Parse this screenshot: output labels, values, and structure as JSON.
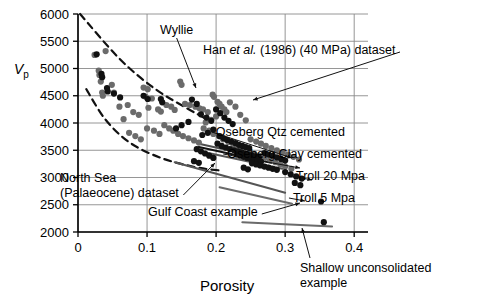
{
  "figure": {
    "background": "#ffffff",
    "ink": "#000000",
    "gridline_color": "#8a8a8a",
    "point_dark": "#111111",
    "point_gray": "#6b6b6b"
  },
  "chart_data": {
    "type": "scatter",
    "title": "",
    "xlabel": "Porosity",
    "ylabel": "Vp",
    "ylabel_parts": {
      "italic": "V",
      "subscript": "p"
    },
    "xlim": [
      0,
      0.42
    ],
    "ylim": [
      2000,
      6000
    ],
    "xticks": [
      0,
      0.1,
      0.2,
      0.3,
      0.4
    ],
    "xticklabels": [
      "0",
      "0.1",
      "0.2",
      "0.3",
      "0.4"
    ],
    "yticks": [
      2000,
      2500,
      3000,
      3500,
      4000,
      4500,
      5000,
      5500,
      6000
    ],
    "yticklabels": [
      "2000",
      "2500",
      "3000",
      "3500",
      "4000",
      "4500",
      "5000",
      "5500",
      "6000"
    ],
    "grid": true,
    "grid_axis": "both",
    "legend": "none",
    "series": [
      {
        "name": "Han et al. (1986) (40 MPa) dataset",
        "marker": "circle",
        "color": "#6b6b6b",
        "points": [
          [
            0.024,
            5250
          ],
          [
            0.04,
            5320
          ],
          [
            0.03,
            4960
          ],
          [
            0.031,
            4880
          ],
          [
            0.033,
            4760
          ],
          [
            0.049,
            4700
          ],
          [
            0.035,
            4560
          ],
          [
            0.036,
            4500
          ],
          [
            0.052,
            4560
          ],
          [
            0.095,
            4650
          ],
          [
            0.101,
            4620
          ],
          [
            0.098,
            4480
          ],
          [
            0.107,
            4450
          ],
          [
            0.148,
            4760
          ],
          [
            0.15,
            4700
          ],
          [
            0.06,
            4300
          ],
          [
            0.072,
            4330
          ],
          [
            0.08,
            4200
          ],
          [
            0.088,
            4150
          ],
          [
            0.066,
            4070
          ],
          [
            0.102,
            4280
          ],
          [
            0.116,
            4250
          ],
          [
            0.12,
            4210
          ],
          [
            0.128,
            4330
          ],
          [
            0.135,
            4300
          ],
          [
            0.14,
            4240
          ],
          [
            0.155,
            4350
          ],
          [
            0.162,
            4330
          ],
          [
            0.17,
            4300
          ],
          [
            0.176,
            4270
          ],
          [
            0.181,
            4250
          ],
          [
            0.188,
            4200
          ],
          [
            0.195,
            4520
          ],
          [
            0.197,
            4480
          ],
          [
            0.202,
            4390
          ],
          [
            0.205,
            4350
          ],
          [
            0.208,
            4300
          ],
          [
            0.212,
            4250
          ],
          [
            0.215,
            4200
          ],
          [
            0.2,
            4120
          ],
          [
            0.193,
            4060
          ],
          [
            0.185,
            4010
          ],
          [
            0.22,
            4380
          ],
          [
            0.228,
            4300
          ],
          [
            0.235,
            4150
          ],
          [
            0.243,
            4050
          ],
          [
            0.074,
            3820
          ],
          [
            0.083,
            3760
          ],
          [
            0.091,
            3700
          ],
          [
            0.1,
            3900
          ],
          [
            0.11,
            3860
          ],
          [
            0.118,
            3800
          ],
          [
            0.125,
            3960
          ],
          [
            0.132,
            3900
          ],
          [
            0.138,
            3860
          ],
          [
            0.145,
            3800
          ],
          [
            0.152,
            3760
          ],
          [
            0.16,
            3720
          ],
          [
            0.168,
            3680
          ],
          [
            0.175,
            3640
          ],
          [
            0.182,
            3900
          ],
          [
            0.19,
            3860
          ],
          [
            0.196,
            3800
          ],
          [
            0.204,
            3760
          ],
          [
            0.21,
            3700
          ],
          [
            0.218,
            3650
          ],
          [
            0.225,
            3600
          ],
          [
            0.232,
            3560
          ],
          [
            0.24,
            3520
          ],
          [
            0.248,
            3470
          ],
          [
            0.255,
            3440
          ],
          [
            0.262,
            3400
          ],
          [
            0.27,
            3360
          ],
          [
            0.278,
            3320
          ],
          [
            0.286,
            3280
          ],
          [
            0.293,
            3240
          ],
          [
            0.3,
            3200
          ],
          [
            0.309,
            3160
          ],
          [
            0.25,
            3700
          ],
          [
            0.258,
            3660
          ],
          [
            0.265,
            3620
          ],
          [
            0.272,
            3580
          ],
          [
            0.28,
            3540
          ],
          [
            0.288,
            3500
          ],
          [
            0.296,
            3460
          ],
          [
            0.304,
            3420
          ],
          [
            0.312,
            3380
          ],
          [
            0.32,
            3330
          ]
        ]
      },
      {
        "name": "North Sea (Palaeocene) dataset",
        "marker": "circle",
        "color": "#111111",
        "points": [
          [
            0.027,
            5260
          ],
          [
            0.034,
            4900
          ],
          [
            0.035,
            4840
          ],
          [
            0.042,
            4640
          ],
          [
            0.043,
            4580
          ],
          [
            0.052,
            4540
          ],
          [
            0.061,
            4470
          ],
          [
            0.095,
            4500
          ],
          [
            0.101,
            4440
          ],
          [
            0.12,
            4440
          ],
          [
            0.122,
            4380
          ],
          [
            0.165,
            4430
          ],
          [
            0.172,
            4350
          ],
          [
            0.16,
            4020
          ],
          [
            0.15,
            3960
          ],
          [
            0.142,
            3900
          ],
          [
            0.178,
            4160
          ],
          [
            0.186,
            4100
          ],
          [
            0.193,
            4040
          ],
          [
            0.2,
            4250
          ],
          [
            0.206,
            4180
          ],
          [
            0.212,
            4100
          ],
          [
            0.218,
            4040
          ],
          [
            0.224,
            3980
          ],
          [
            0.196,
            3880
          ],
          [
            0.188,
            3820
          ],
          [
            0.18,
            3780
          ],
          [
            0.205,
            3760
          ],
          [
            0.211,
            3720
          ],
          [
            0.216,
            3690
          ],
          [
            0.222,
            3660
          ],
          [
            0.228,
            3630
          ],
          [
            0.233,
            3600
          ],
          [
            0.238,
            3580
          ],
          [
            0.243,
            3560
          ],
          [
            0.248,
            3540
          ],
          [
            0.202,
            3620
          ],
          [
            0.208,
            3580
          ],
          [
            0.214,
            3550
          ],
          [
            0.22,
            3520
          ],
          [
            0.226,
            3500
          ],
          [
            0.232,
            3480
          ],
          [
            0.237,
            3460
          ],
          [
            0.242,
            3440
          ],
          [
            0.247,
            3420
          ],
          [
            0.252,
            3400
          ],
          [
            0.257,
            3390
          ],
          [
            0.262,
            3370
          ],
          [
            0.23,
            3420
          ],
          [
            0.235,
            3400
          ],
          [
            0.24,
            3380
          ],
          [
            0.245,
            3360
          ],
          [
            0.25,
            3340
          ],
          [
            0.255,
            3320
          ],
          [
            0.26,
            3300
          ],
          [
            0.265,
            3290
          ],
          [
            0.27,
            3450
          ],
          [
            0.276,
            3420
          ],
          [
            0.282,
            3400
          ],
          [
            0.288,
            3370
          ],
          [
            0.294,
            3340
          ],
          [
            0.3,
            3310
          ],
          [
            0.252,
            3260
          ],
          [
            0.258,
            3240
          ],
          [
            0.264,
            3220
          ],
          [
            0.27,
            3200
          ],
          [
            0.276,
            3180
          ],
          [
            0.282,
            3160
          ],
          [
            0.288,
            3140
          ],
          [
            0.172,
            3520
          ],
          [
            0.178,
            3480
          ],
          [
            0.184,
            3440
          ],
          [
            0.19,
            3400
          ],
          [
            0.196,
            3360
          ],
          [
            0.168,
            3300
          ],
          [
            0.175,
            3270
          ],
          [
            0.24,
            3180
          ],
          [
            0.246,
            3150
          ],
          [
            0.3,
            3100
          ],
          [
            0.308,
            3060
          ],
          [
            0.316,
            3020
          ],
          [
            0.324,
            2980
          ],
          [
            0.314,
            2900
          ],
          [
            0.322,
            2860
          ],
          [
            0.352,
            2560
          ],
          [
            0.356,
            2180
          ]
        ]
      }
    ],
    "curves": [
      {
        "name": "Wyllie time-average line",
        "style": "dashed",
        "color": "#111111",
        "points": [
          [
            0.003,
            6000
          ],
          [
            0.06,
            5180
          ],
          [
            0.11,
            4640
          ],
          [
            0.155,
            4290
          ],
          [
            0.185,
            4080
          ]
        ]
      },
      {
        "name": "lower-bound dashed curve",
        "style": "dashed",
        "color": "#111111",
        "points": [
          [
            0.012,
            4620
          ],
          [
            0.04,
            4060
          ],
          [
            0.075,
            3640
          ],
          [
            0.12,
            3360
          ],
          [
            0.17,
            3190
          ],
          [
            0.205,
            3130
          ]
        ]
      },
      {
        "name": "Oseberg Qtz cemented trend",
        "style": "solid",
        "color": "#4d4d4d",
        "points": [
          [
            0.175,
            3620
          ],
          [
            0.272,
            3350
          ]
        ]
      },
      {
        "name": "Oseberg Clay cemented trend",
        "style": "solid",
        "color": "#111111",
        "points": [
          [
            0.175,
            3560
          ],
          [
            0.28,
            3270
          ]
        ]
      },
      {
        "name": "Troll 20 Mpa trend",
        "style": "solid",
        "color": "#555555",
        "points": [
          [
            0.17,
            3500
          ],
          [
            0.296,
            3160
          ]
        ]
      },
      {
        "name": "Troll 5 Mpa trend",
        "style": "solid",
        "color": "#555555",
        "points": [
          [
            0.14,
            3280
          ],
          [
            0.3,
            2720
          ]
        ]
      },
      {
        "name": "Gulf Coast trend",
        "style": "solid",
        "color": "#6b6b6b",
        "points": [
          [
            0.205,
            2820
          ],
          [
            0.31,
            2520
          ]
        ]
      },
      {
        "name": "Shallow unconsolidated trend",
        "style": "solid",
        "color": "#6b6b6b",
        "points": [
          [
            0.238,
            2180
          ],
          [
            0.368,
            2100
          ]
        ]
      }
    ],
    "annotations": [
      {
        "id": "wyllie",
        "label": "Wyllie",
        "x": 160,
        "y": 34,
        "leader_to": [
          196,
          88
        ]
      },
      {
        "id": "han",
        "label_pre": "Han ",
        "label_italic": "et al.",
        "label_post": " (1986) (40 MPa) dataset",
        "x": 203,
        "y": 54,
        "leader_to": [
          253,
          100
        ]
      },
      {
        "id": "north-sea",
        "line1": "North Sea",
        "line2": "(Palaeocene) dataset",
        "x": 60,
        "y": 182,
        "leader_to": [
          215,
          163
        ]
      },
      {
        "id": "gulf-coast",
        "label": "Gulf Coast example",
        "x": 148,
        "y": 216,
        "leader_to": [
          300,
          203
        ]
      },
      {
        "id": "oseberg-qtz",
        "label": "Oseberg Qtz cemented",
        "x": 345,
        "y": 136,
        "leader_to": [
          292,
          158
        ]
      },
      {
        "id": "oseberg-clay",
        "label": "Oseberg Clay cemented",
        "x": 362,
        "y": 158,
        "leader_to": [
          300,
          168
        ]
      },
      {
        "id": "troll-20",
        "label": "Troll 20 Mpa",
        "x": 365,
        "y": 180,
        "leader_to": [
          312,
          180
        ]
      },
      {
        "id": "troll-5",
        "label": "Troll 5 Mpa",
        "x": 355,
        "y": 202,
        "leader_to": [
          305,
          201
        ]
      },
      {
        "id": "shallow",
        "line1": "Shallow unconsolidated",
        "line2": "example",
        "x": 300,
        "y": 272,
        "leader_to": [
          302,
          228
        ]
      }
    ]
  }
}
